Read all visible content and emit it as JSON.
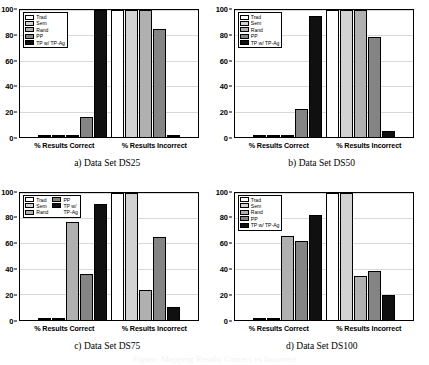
{
  "figure": {
    "series_names": [
      "Trad",
      "Sem",
      "Rand",
      "PP",
      "TP w/ TP-Ag"
    ],
    "series_colors": [
      "#ffffff",
      "#d2d2d2",
      "#b0b0b0",
      "#848484",
      "#101010"
    ],
    "legend_wrapped_label_line1": "TP w/",
    "legend_wrapped_label_line2": "TP-Ag",
    "bottom_caption_artifact": "Figure: Mapping Results Correct vs Incorrect"
  },
  "panels": [
    {
      "subcaption": "a) Data Set DS25",
      "yticks": [
        "0",
        "20",
        "40",
        "60",
        "80",
        "100"
      ],
      "xlabels": [
        "% Results Correct",
        "% Results Incorrect"
      ],
      "legend_layout": "single-column"
    },
    {
      "subcaption": "b) Data Set DS50",
      "yticks": [
        "0",
        "20",
        "40",
        "60",
        "80",
        "100"
      ],
      "xlabels": [
        "% Results Correct",
        "% Results Incorrect"
      ],
      "legend_layout": "single-column"
    },
    {
      "subcaption": "c) Data Set DS75",
      "yticks": [
        "0",
        "20",
        "40",
        "60",
        "80",
        "100"
      ],
      "xlabels": [
        "% Results Correct",
        "% Results Incorrect"
      ],
      "legend_layout": "two-column"
    },
    {
      "subcaption": "d) Data Set DS100",
      "yticks": [
        "0",
        "20",
        "40",
        "60",
        "80",
        "100"
      ],
      "xlabels": [
        "% Results Correct",
        "% Results Incorrect"
      ],
      "legend_layout": "single-column"
    }
  ],
  "chart_data": [
    {
      "type": "bar",
      "title": "a) Data Set DS25",
      "categories": [
        "% Results Correct",
        "% Results Incorrect"
      ],
      "series": [
        {
          "name": "Trad",
          "values": [
            0,
            100
          ]
        },
        {
          "name": "Sem",
          "values": [
            0,
            100
          ]
        },
        {
          "name": "Rand",
          "values": [
            0,
            100
          ]
        },
        {
          "name": "PP",
          "values": [
            16,
            85
          ]
        },
        {
          "name": "TP w/ TP-Ag",
          "values": [
            100,
            1
          ]
        }
      ],
      "xlabel": "",
      "ylabel": "",
      "ylim": [
        0,
        100
      ],
      "yticks": [
        0,
        20,
        40,
        60,
        80,
        100
      ],
      "grid": true,
      "legend_position": "upper-left"
    },
    {
      "type": "bar",
      "title": "b) Data Set DS50",
      "categories": [
        "% Results Correct",
        "% Results Incorrect"
      ],
      "series": [
        {
          "name": "Trad",
          "values": [
            0,
            100
          ]
        },
        {
          "name": "Sem",
          "values": [
            0,
            100
          ]
        },
        {
          "name": "Rand",
          "values": [
            0,
            100
          ]
        },
        {
          "name": "PP",
          "values": [
            22,
            79
          ]
        },
        {
          "name": "TP w/ TP-Ag",
          "values": [
            95,
            5
          ]
        }
      ],
      "xlabel": "",
      "ylabel": "",
      "ylim": [
        0,
        100
      ],
      "yticks": [
        0,
        20,
        40,
        60,
        80,
        100
      ],
      "grid": true,
      "legend_position": "upper-left"
    },
    {
      "type": "bar",
      "title": "c) Data Set DS75",
      "categories": [
        "% Results Correct",
        "% Results Incorrect"
      ],
      "series": [
        {
          "name": "Trad",
          "values": [
            0,
            100
          ]
        },
        {
          "name": "Sem",
          "values": [
            0,
            100
          ]
        },
        {
          "name": "Rand",
          "values": [
            77,
            23
          ]
        },
        {
          "name": "PP",
          "values": [
            36,
            65
          ]
        },
        {
          "name": "TP w/ TP-Ag",
          "values": [
            91,
            10
          ]
        }
      ],
      "xlabel": "",
      "ylabel": "",
      "ylim": [
        0,
        100
      ],
      "yticks": [
        0,
        20,
        40,
        60,
        80,
        100
      ],
      "grid": true,
      "legend_position": "upper-left"
    },
    {
      "type": "bar",
      "title": "d) Data Set DS100",
      "categories": [
        "% Results Correct",
        "% Results Incorrect"
      ],
      "series": [
        {
          "name": "Trad",
          "values": [
            0,
            100
          ]
        },
        {
          "name": "Sem",
          "values": [
            0,
            100
          ]
        },
        {
          "name": "Rand",
          "values": [
            66,
            34
          ]
        },
        {
          "name": "PP",
          "values": [
            62,
            38
          ]
        },
        {
          "name": "TP w/ TP-Ag",
          "values": [
            82,
            19
          ]
        }
      ],
      "xlabel": "",
      "ylabel": "",
      "ylim": [
        0,
        100
      ],
      "yticks": [
        0,
        20,
        40,
        60,
        80,
        100
      ],
      "grid": true,
      "legend_position": "upper-left"
    }
  ]
}
